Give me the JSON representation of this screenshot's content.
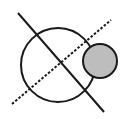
{
  "diagram": {
    "width": 136,
    "height": 119,
    "background": "#ffffff",
    "stroke_color": "#1a1a1a",
    "fill_color": "#bdbdbd",
    "large_circle": {
      "cx": 58,
      "cy": 65,
      "r": 37
    },
    "small_circle": {
      "cx": 100,
      "cy": 61,
      "r": 17
    },
    "solid_line": {
      "x1": 18,
      "y1": 13,
      "x2": 104,
      "y2": 112
    },
    "dashed_line": {
      "x1": 12,
      "y1": 104,
      "x2": 111,
      "y2": 20
    }
  }
}
